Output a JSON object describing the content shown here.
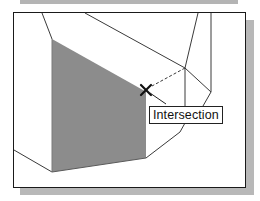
{
  "snap_tooltip": {
    "label": "Intersection"
  },
  "cursor": {
    "icon": "x-snap-marker-icon",
    "x": 146,
    "y": 90
  },
  "colors": {
    "frame_border": "#1a1a1a",
    "shaded_face": "#8c8c8c",
    "edge_lines": "#3a3a3a",
    "shadow": "#b8b8b8",
    "background": "#ffffff"
  }
}
